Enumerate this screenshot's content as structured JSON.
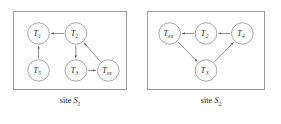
{
  "figure": {
    "background_color": "#ffffff",
    "border_color": "#9a9a9a",
    "node_stroke_color": "#8e8e8e",
    "edge_color": "#6e6e6e",
    "text_color": "#1a1a1a"
  },
  "panels": [
    {
      "id": "site-s1",
      "caption_word": "site",
      "caption_var": "S",
      "caption_sub": "1",
      "nodes": [
        {
          "id": "t1",
          "base": "T",
          "sub": "1",
          "cx": 25,
          "cy": 22
        },
        {
          "id": "t2",
          "base": "T",
          "sub": "2",
          "cx": 63,
          "cy": 22
        },
        {
          "id": "t5",
          "base": "T",
          "sub": "5",
          "cx": 25,
          "cy": 60
        },
        {
          "id": "t3",
          "base": "T",
          "sub": "3",
          "cx": 63,
          "cy": 60
        },
        {
          "id": "tex",
          "base": "T",
          "sub": "ex",
          "cx": 96,
          "cy": 60
        }
      ],
      "edges": [
        {
          "id": "t2-t1",
          "from": "t2",
          "to": "t1"
        },
        {
          "id": "t5-t1",
          "from": "t5",
          "to": "t1"
        },
        {
          "id": "t2-t3",
          "from": "t2",
          "to": "t3"
        },
        {
          "id": "t3-tex",
          "from": "t3",
          "to": "tex"
        },
        {
          "id": "tex-t2",
          "from": "tex",
          "to": "t2"
        }
      ]
    },
    {
      "id": "site-s2",
      "caption_word": "site",
      "caption_var": "S",
      "caption_sub": "2",
      "nodes": [
        {
          "id": "tex",
          "base": "T",
          "sub": "ex",
          "cx": 22,
          "cy": 22
        },
        {
          "id": "t2",
          "base": "T",
          "sub": "2",
          "cx": 59,
          "cy": 22
        },
        {
          "id": "t4",
          "base": "T",
          "sub": "4",
          "cx": 96,
          "cy": 22
        },
        {
          "id": "t3",
          "base": "T",
          "sub": "3",
          "cx": 59,
          "cy": 60
        }
      ],
      "edges": [
        {
          "id": "t4-t2",
          "from": "t4",
          "to": "t2"
        },
        {
          "id": "t2-tex",
          "from": "t2",
          "to": "tex"
        },
        {
          "id": "tex-t3",
          "from": "tex",
          "to": "t3"
        },
        {
          "id": "t3-t4",
          "from": "t3",
          "to": "t4"
        }
      ]
    }
  ],
  "node_radius": 11
}
